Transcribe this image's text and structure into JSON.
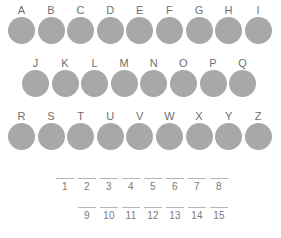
{
  "worksheet": {
    "title": "Alphabet circles worksheet",
    "background_color": "#ffffff",
    "circle_color": "#a8a8a8",
    "label_color": "#6f6f6f",
    "blank_line_color": "#b4b4b4",
    "number_color": "#7b7b7b"
  },
  "letter_rows": [
    {
      "row_name": "row-a-i",
      "letters": [
        "A",
        "B",
        "C",
        "D",
        "E",
        "F",
        "G",
        "H",
        "I"
      ]
    },
    {
      "row_name": "row-j-q",
      "letters": [
        "J",
        "K",
        "L",
        "M",
        "N",
        "O",
        "P",
        "Q"
      ]
    },
    {
      "row_name": "row-r-z",
      "letters": [
        "R",
        "S",
        "T",
        "U",
        "V",
        "W",
        "X",
        "Y",
        "Z"
      ]
    }
  ],
  "blank_rows": [
    {
      "row_name": "blanks-1-8",
      "numbers": [
        "1",
        "2",
        "3",
        "4",
        "5",
        "6",
        "7",
        "8"
      ]
    },
    {
      "row_name": "blanks-9-15",
      "numbers": [
        "9",
        "10",
        "11",
        "12",
        "13",
        "14",
        "15"
      ]
    }
  ]
}
